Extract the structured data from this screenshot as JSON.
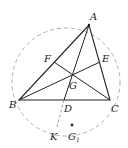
{
  "diagram": {
    "type": "geometry",
    "points": {
      "A": {
        "label": "A",
        "x": 89,
        "y": 25
      },
      "B": {
        "label": "B",
        "x": 19,
        "y": 100
      },
      "C": {
        "label": "C",
        "x": 110,
        "y": 100
      },
      "D": {
        "label": "D",
        "x": 64,
        "y": 100
      },
      "E": {
        "label": "E",
        "x": 100,
        "y": 62
      },
      "F": {
        "label": "F",
        "x": 54,
        "y": 62
      },
      "G": {
        "label": "G",
        "x": 72,
        "y": 75
      },
      "K": {
        "label": "K",
        "x": 57,
        "y": 127
      },
      "G1": {
        "label": "G",
        "sub": "1",
        "x": 72,
        "y": 127
      }
    },
    "circle": {
      "cx": 66,
      "cy": 82,
      "r": 54,
      "style": "dashed"
    },
    "colors": {
      "stroke": "#222222",
      "dashed": "#888888",
      "background": "#ffffff"
    }
  }
}
